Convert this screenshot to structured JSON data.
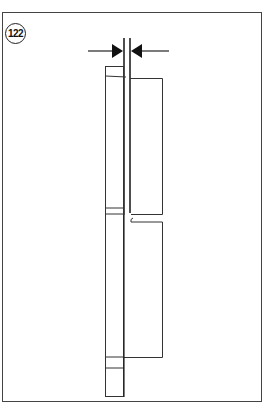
{
  "figure": {
    "number": "122",
    "type": "technical-line-drawing",
    "colors": {
      "line": "#333333",
      "background": "#ffffff",
      "frame": "#444444"
    }
  }
}
